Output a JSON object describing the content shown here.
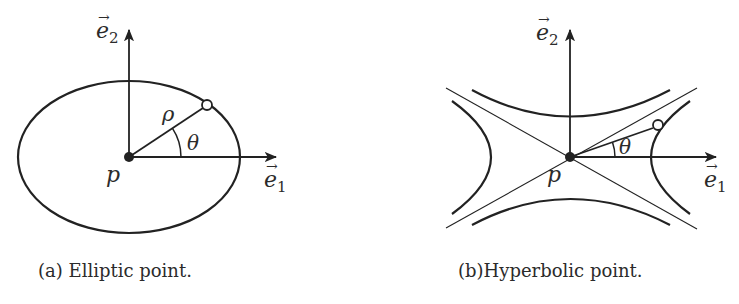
{
  "figures": [
    {
      "id": "a",
      "type": "elliptic",
      "caption": "(a) Elliptic point.",
      "labels": {
        "e1_base": "e",
        "e1_sub": "1",
        "e2_base": "e",
        "e2_sub": "2",
        "point": "p",
        "radius": "ρ",
        "angle": "θ"
      }
    },
    {
      "id": "b",
      "type": "hyperbolic",
      "caption": "(b)Hyperbolic point.",
      "labels": {
        "e1_base": "e",
        "e1_sub": "1",
        "e2_base": "e",
        "e2_sub": "2",
        "point": "p",
        "angle": "θ"
      }
    }
  ],
  "colors": {
    "stroke": "#222222",
    "text": "#2b2b2b",
    "background": "#ffffff"
  }
}
